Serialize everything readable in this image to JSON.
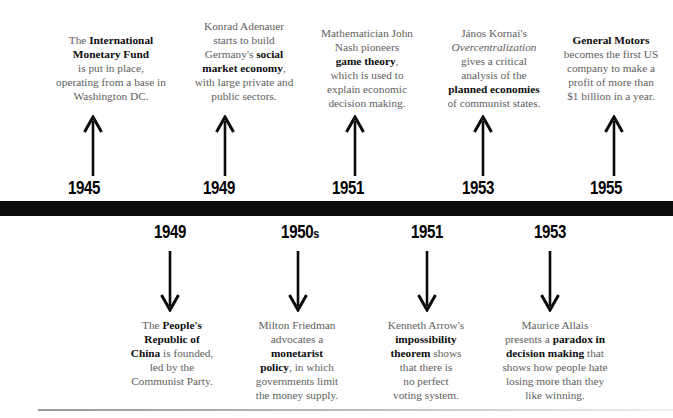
{
  "timeline": {
    "bar_color": "#0d0d0d",
    "text_color": "#5e5e5e",
    "emphasis_color": "#0c0c0c"
  },
  "events_above": [
    {
      "year": "1945",
      "arrow": "arrow-up-icon",
      "text_plain": "The International Monetary Fund is put in place, operating from a base in Washington DC.",
      "lines": [
        [
          {
            "t": "The ",
            "b": false
          },
          {
            "t": "International",
            "b": true
          }
        ],
        [
          {
            "t": "Monetary Fund",
            "b": true
          }
        ],
        [
          {
            "t": "is put in place,",
            "b": false
          }
        ],
        [
          {
            "t": "operating from a base in",
            "b": false
          }
        ],
        [
          {
            "t": "Washington DC.",
            "b": false
          }
        ]
      ]
    },
    {
      "year": "1949",
      "arrow": "arrow-up-icon",
      "text_plain": "Konrad Adenauer starts to build Germany's social market economy, with large private and public sectors.",
      "lines": [
        [
          {
            "t": "Konrad Adenauer",
            "b": false
          }
        ],
        [
          {
            "t": "starts to build",
            "b": false
          }
        ],
        [
          {
            "t": "Germany's ",
            "b": false
          },
          {
            "t": "social",
            "b": true
          }
        ],
        [
          {
            "t": "market economy",
            "b": true
          },
          {
            "t": ",",
            "b": false
          }
        ],
        [
          {
            "t": "with large private and",
            "b": false
          }
        ],
        [
          {
            "t": "public sectors.",
            "b": false
          }
        ]
      ]
    },
    {
      "year": "1951",
      "arrow": "arrow-up-icon",
      "text_plain": "Mathematician John Nash pioneers game theory, which is used to explain economic decision making.",
      "lines": [
        [
          {
            "t": "Mathematician John",
            "b": false
          }
        ],
        [
          {
            "t": "Nash pioneers",
            "b": false
          }
        ],
        [
          {
            "t": "game theory",
            "b": true
          },
          {
            "t": ",",
            "b": false
          }
        ],
        [
          {
            "t": "which is used to",
            "b": false
          }
        ],
        [
          {
            "t": "explain economic",
            "b": false
          }
        ],
        [
          {
            "t": "decision making.",
            "b": false
          }
        ]
      ]
    },
    {
      "year": "1953",
      "arrow": "arrow-up-icon",
      "text_plain": "János Kornai's Overcentralization gives a critical analysis of the planned economies of communist states.",
      "lines": [
        [
          {
            "t": "János Kornai's",
            "b": false
          }
        ],
        [
          {
            "t": "Overcentralization",
            "b": false,
            "i": true
          }
        ],
        [
          {
            "t": "gives a critical",
            "b": false
          }
        ],
        [
          {
            "t": "analysis of the",
            "b": false
          }
        ],
        [
          {
            "t": "planned economies",
            "b": true
          }
        ],
        [
          {
            "t": "of communist states.",
            "b": false
          }
        ]
      ]
    },
    {
      "year": "1955",
      "arrow": "arrow-up-icon",
      "text_plain": "General Motors becomes the first US company to make a profit of more than $1 billion in a year.",
      "lines": [
        [
          {
            "t": "General Motors",
            "b": true
          }
        ],
        [
          {
            "t": "becomes the first US",
            "b": false
          }
        ],
        [
          {
            "t": "company to make a",
            "b": false
          }
        ],
        [
          {
            "t": "profit of more than",
            "b": false
          }
        ],
        [
          {
            "t": "$1 billion in a year.",
            "b": false
          }
        ]
      ]
    }
  ],
  "events_below": [
    {
      "year": "1949",
      "year_suffix": "",
      "arrow": "arrow-down-icon",
      "text_plain": "The People's Republic of China is founded, led by the Communist Party.",
      "lines": [
        [
          {
            "t": "The ",
            "b": false
          },
          {
            "t": "People's",
            "b": true
          }
        ],
        [
          {
            "t": "Republic of",
            "b": true
          }
        ],
        [
          {
            "t": "China",
            "b": true
          },
          {
            "t": " is founded,",
            "b": false
          }
        ],
        [
          {
            "t": "led by the",
            "b": false
          }
        ],
        [
          {
            "t": "Communist Party.",
            "b": false
          }
        ]
      ]
    },
    {
      "year": "1950",
      "year_suffix": "s",
      "arrow": "arrow-down-icon",
      "text_plain": "Milton Friedman advocates a monetarist policy, in which governments limit the money supply.",
      "lines": [
        [
          {
            "t": "Milton Friedman",
            "b": false
          }
        ],
        [
          {
            "t": "advocates a",
            "b": false
          }
        ],
        [
          {
            "t": "monetarist",
            "b": true
          }
        ],
        [
          {
            "t": "policy",
            "b": true
          },
          {
            "t": ", in which",
            "b": false
          }
        ],
        [
          {
            "t": "governments limit",
            "b": false
          }
        ],
        [
          {
            "t": "the money supply.",
            "b": false
          }
        ]
      ]
    },
    {
      "year": "1951",
      "year_suffix": "",
      "arrow": "arrow-down-icon",
      "text_plain": "Kenneth Arrow's impossibility theorem shows that there is no perfect voting system.",
      "lines": [
        [
          {
            "t": "Kenneth Arrow's",
            "b": false
          }
        ],
        [
          {
            "t": "impossibility",
            "b": true
          }
        ],
        [
          {
            "t": "theorem",
            "b": true
          },
          {
            "t": " shows",
            "b": false
          }
        ],
        [
          {
            "t": "that there is",
            "b": false
          }
        ],
        [
          {
            "t": "no perfect",
            "b": false
          }
        ],
        [
          {
            "t": "voting system.",
            "b": false
          }
        ]
      ]
    },
    {
      "year": "1953",
      "year_suffix": "",
      "arrow": "arrow-down-icon",
      "text_plain": "Maurice Allais presents a paradox in decision making that shows how people hate losing more than they like winning.",
      "lines": [
        [
          {
            "t": "Maurice Allais",
            "b": false
          }
        ],
        [
          {
            "t": "presents a ",
            "b": false
          },
          {
            "t": "paradox in",
            "b": true
          }
        ],
        [
          {
            "t": "decision making",
            "b": true
          },
          {
            "t": " that",
            "b": false
          }
        ],
        [
          {
            "t": "shows how people hate",
            "b": false
          }
        ],
        [
          {
            "t": "losing more than they",
            "b": false
          }
        ],
        [
          {
            "t": "like winning.",
            "b": false
          }
        ]
      ]
    }
  ]
}
